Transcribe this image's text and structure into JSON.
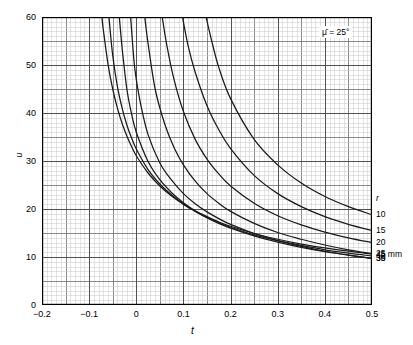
{
  "chart_data": {
    "type": "line",
    "title": "",
    "xlabel": "t",
    "ylabel": "u",
    "xlim": [
      -0.2,
      0.5
    ],
    "ylim": [
      0,
      60
    ],
    "xticks": [
      -0.2,
      -0.1,
      0,
      0.1,
      0.2,
      0.3,
      0.4,
      0.5
    ],
    "xticklabels": [
      "−0.2",
      "−0.1",
      "0",
      "0.1",
      "0.2",
      "0.3",
      "0.4",
      "0.5"
    ],
    "yticks": [
      0,
      10,
      20,
      30,
      40,
      50,
      60
    ],
    "yticklabels": [
      "0",
      "10",
      "20",
      "30",
      "40",
      "50",
      "60"
    ],
    "grid": "minor-and-major",
    "minor_x_step": 0.01,
    "minor_y_step": 1,
    "major_x_step": 0.05,
    "major_y_step": 5,
    "legend_position": "right-outside",
    "annotation": "μ̄ = 25°",
    "legend_title": "r",
    "series": [
      {
        "name": "45 mm",
        "label": "45 mm",
        "r": 45,
        "x": [
          -0.073,
          -0.07,
          -0.06,
          -0.05,
          -0.04,
          -0.03,
          -0.02,
          -0.01,
          0,
          0.025,
          0.05,
          0.075,
          0.1,
          0.125,
          0.15,
          0.175,
          0.2,
          0.25,
          0.3,
          0.35,
          0.4,
          0.45,
          0.5
        ],
        "y": [
          60,
          57.4,
          50.2,
          45.0,
          41.0,
          37.8,
          35.2,
          33.0,
          31.1,
          27.5,
          24.8,
          22.7,
          21.0,
          19.6,
          18.4,
          17.3,
          16.4,
          14.9,
          13.7,
          12.7,
          11.9,
          11.2,
          10.6
        ]
      },
      {
        "name": "40",
        "label": "40",
        "r": 40,
        "x": [
          -0.058,
          -0.05,
          -0.04,
          -0.03,
          -0.02,
          -0.01,
          0,
          0.025,
          0.05,
          0.075,
          0.1,
          0.125,
          0.15,
          0.175,
          0.2,
          0.25,
          0.3,
          0.35,
          0.4,
          0.45,
          0.5
        ],
        "y": [
          60,
          52.0,
          45.5,
          41.0,
          37.5,
          34.8,
          32.5,
          28.2,
          25.2,
          22.9,
          21.0,
          19.5,
          18.2,
          17.1,
          16.2,
          14.6,
          13.4,
          12.4,
          11.5,
          10.8,
          10.2
        ]
      },
      {
        "name": "35",
        "label": "35",
        "r": 35,
        "x": [
          -0.036,
          -0.03,
          -0.02,
          -0.01,
          0,
          0.025,
          0.05,
          0.075,
          0.1,
          0.125,
          0.15,
          0.175,
          0.2,
          0.25,
          0.3,
          0.35,
          0.4,
          0.45,
          0.5
        ],
        "y": [
          60,
          53.5,
          45.0,
          39.8,
          36.0,
          29.9,
          26.1,
          23.4,
          21.3,
          19.6,
          18.2,
          17.0,
          16.0,
          14.4,
          13.1,
          12.0,
          11.1,
          10.4,
          9.7
        ]
      },
      {
        "name": "30",
        "label": "30",
        "r": 30,
        "x": [
          -0.012,
          -0.005,
          0,
          0.01,
          0.025,
          0.05,
          0.075,
          0.1,
          0.125,
          0.15,
          0.175,
          0.2,
          0.25,
          0.3,
          0.35,
          0.4,
          0.45,
          0.5
        ],
        "y": [
          60,
          51.0,
          47.0,
          41.5,
          35.5,
          29.6,
          26.0,
          23.2,
          21.1,
          19.4,
          18.0,
          16.8,
          14.9,
          13.4,
          12.2,
          11.2,
          10.4,
          9.7
        ]
      },
      {
        "name": "25",
        "label": "25",
        "r": 25,
        "x": [
          0.018,
          0.025,
          0.04,
          0.06,
          0.08,
          0.1,
          0.125,
          0.15,
          0.175,
          0.2,
          0.25,
          0.3,
          0.35,
          0.4,
          0.45,
          0.5
        ],
        "y": [
          60,
          54.5,
          45.0,
          37.8,
          32.8,
          29.2,
          25.8,
          23.2,
          21.2,
          19.5,
          17.0,
          15.1,
          13.7,
          12.5,
          11.5,
          10.7
        ]
      },
      {
        "name": "20",
        "label": "20",
        "r": 20,
        "x": [
          0.055,
          0.065,
          0.08,
          0.1,
          0.125,
          0.15,
          0.175,
          0.2,
          0.25,
          0.3,
          0.35,
          0.4,
          0.45,
          0.5
        ],
        "y": [
          60,
          54.0,
          47.0,
          40.3,
          34.5,
          30.4,
          27.3,
          24.8,
          21.2,
          18.6,
          16.7,
          15.2,
          14.0,
          13.0
        ]
      },
      {
        "name": "15",
        "label": "15",
        "r": 15,
        "x": [
          0.098,
          0.11,
          0.125,
          0.15,
          0.175,
          0.2,
          0.25,
          0.3,
          0.35,
          0.4,
          0.45,
          0.5
        ],
        "y": [
          60,
          54.0,
          48.5,
          41.5,
          36.5,
          32.6,
          27.0,
          23.2,
          20.5,
          18.4,
          16.8,
          15.5
        ]
      },
      {
        "name": "10",
        "label": "10",
        "r": 10,
        "x": [
          0.148,
          0.16,
          0.175,
          0.2,
          0.25,
          0.3,
          0.35,
          0.4,
          0.45,
          0.5
        ],
        "y": [
          60,
          55.0,
          49.5,
          43.0,
          34.5,
          29.2,
          25.4,
          22.6,
          20.5,
          18.8
        ]
      }
    ]
  },
  "legend": {
    "title": "r",
    "entries": [
      "45 mm",
      "40",
      "35",
      "30",
      "25",
      "20",
      "15",
      "10"
    ]
  },
  "annotation": {
    "mu": "μ̄ = 25°"
  },
  "axes": {
    "xlabel": "t",
    "ylabel": "u",
    "xticklabels": [
      "−0.2",
      "−0.1",
      "0",
      "0.1",
      "0.2",
      "0.3",
      "0.4",
      "0.5"
    ],
    "yticklabels": [
      "0",
      "10",
      "20",
      "30",
      "40",
      "50",
      "60"
    ]
  },
  "colors": {
    "curve": "#1a1a1a",
    "major_grid": "#6e6e6e",
    "minor_grid": "#c8c8c8",
    "axis": "#000000",
    "background": "#ffffff"
  }
}
